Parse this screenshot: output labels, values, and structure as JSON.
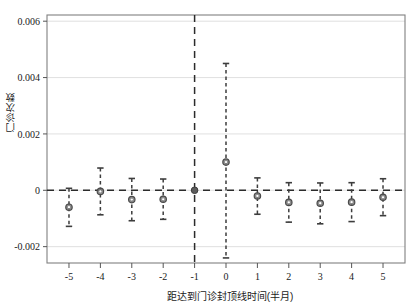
{
  "chart_data": {
    "type": "scatter",
    "title": "",
    "xlabel": "距达到门诊封顶线时间(半月)",
    "ylabel": "门诊次数",
    "xlim": [
      -5.7,
      5.7
    ],
    "ylim": [
      -0.00258,
      0.00622
    ],
    "grid": true,
    "legend": null,
    "x_ticks": [
      "-5",
      "-4",
      "-3",
      "-2",
      "-1",
      "0",
      "1",
      "2",
      "3",
      "4",
      "5"
    ],
    "x_tick_values": [
      -5,
      -4,
      -3,
      -2,
      -1,
      0,
      1,
      2,
      3,
      4,
      5
    ],
    "y_ticks": [
      "0.006",
      "0.004",
      "0.002",
      "0",
      "-0.002"
    ],
    "y_tick_values": [
      0.006,
      0.004,
      0.002,
      0,
      -0.002
    ],
    "reference_lines": {
      "vertical_x": -1,
      "horizontal_y": 0
    },
    "marker_color": "#7a7a7a",
    "errorbar_color": "#3d3d3d",
    "series": [
      {
        "name": "门诊次数效应",
        "x": [
          -5,
          -4,
          -3,
          -2,
          -1,
          0,
          1,
          2,
          3,
          4,
          5
        ],
        "values": [
          -0.0006,
          -4e-05,
          -0.00033,
          -0.00032,
          0.0,
          0.001,
          -0.0002,
          -0.00043,
          -0.00046,
          -0.00042,
          -0.00025
        ],
        "ci_low": [
          -0.00128,
          -0.00087,
          -0.00108,
          -0.00103,
          0.0,
          -0.0024,
          -0.00085,
          -0.00113,
          -0.00119,
          -0.00111,
          -0.0009
        ],
        "ci_high": [
          7e-05,
          0.00079,
          0.00042,
          0.0004,
          0.0,
          0.0045,
          0.00044,
          0.00027,
          0.00026,
          0.00027,
          0.00041
        ],
        "is_reference": [
          false,
          false,
          false,
          false,
          true,
          false,
          false,
          false,
          false,
          false,
          false
        ]
      }
    ]
  }
}
